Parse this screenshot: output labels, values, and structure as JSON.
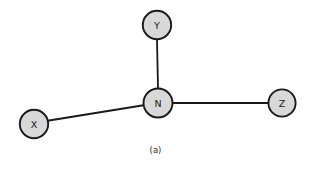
{
  "figure": {
    "caption": "(a)",
    "background_color": "#ffffff",
    "node_fill_color": "#d8d8d8",
    "node_stroke_color": "#1a1a1a",
    "edge_color": "#1a1a1a",
    "label_color": "#1a1a1a"
  },
  "graph": {
    "type": "node-link-diagram",
    "nodes": [
      {
        "id": "Y",
        "label": "Y",
        "cx": 157,
        "cy": 25,
        "r": 15
      },
      {
        "id": "N",
        "label": "N",
        "cx": 158,
        "cy": 103,
        "r": 15
      },
      {
        "id": "X",
        "label": "X",
        "cx": 34,
        "cy": 124,
        "r": 15
      },
      {
        "id": "Z",
        "label": "Z",
        "cx": 282,
        "cy": 103,
        "r": 14
      }
    ],
    "edges": [
      {
        "from": "Y",
        "to": "N",
        "x1": 157,
        "y1": 40,
        "x2": 158,
        "y2": 88
      },
      {
        "from": "X",
        "to": "N",
        "x1": 48,
        "y1": 121,
        "x2": 143,
        "y2": 105
      },
      {
        "from": "N",
        "to": "Z",
        "x1": 173,
        "y1": 103,
        "x2": 268,
        "y2": 103
      }
    ]
  }
}
